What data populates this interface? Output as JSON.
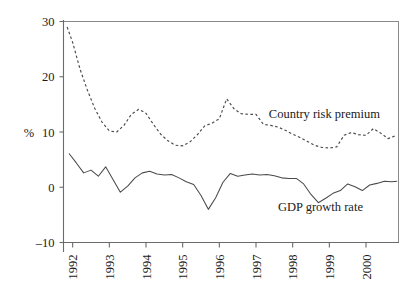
{
  "chart_data": {
    "type": "line",
    "title": "",
    "xlabel": "",
    "ylabel": "%",
    "ylim": [
      -10,
      30
    ],
    "xlim": [
      1991.75,
      2000.9
    ],
    "yticks": [
      30,
      20,
      10,
      0,
      -10
    ],
    "ytick_labels": [
      "30",
      "20",
      "10",
      "0",
      "–10"
    ],
    "xticks": [
      1992,
      1993,
      1994,
      1995,
      1996,
      1997,
      1998,
      1999,
      2000
    ],
    "xtick_labels": [
      "1992",
      "1993",
      "1994",
      "1995",
      "1996",
      "1997",
      "1998",
      "1999",
      "2000"
    ],
    "grid": false,
    "legend_position": "inline-annotation",
    "series": [
      {
        "name": "Country risk premium",
        "style": "dashed",
        "color": "#4a4a4a",
        "label_x": 1997.35,
        "label_y": 12.6,
        "x": [
          1991.85,
          1992.0,
          1992.2,
          1992.4,
          1992.6,
          1992.8,
          1993.0,
          1993.2,
          1993.4,
          1993.6,
          1993.8,
          1994.0,
          1994.2,
          1994.4,
          1994.6,
          1994.8,
          1995.0,
          1995.2,
          1995.4,
          1995.6,
          1995.8,
          1996.0,
          1996.2,
          1996.4,
          1996.6,
          1996.8,
          1997.0,
          1997.2,
          1997.4,
          1997.6,
          1997.8,
          1998.0,
          1998.2,
          1998.4,
          1998.6,
          1998.8,
          1999.0,
          1999.2,
          1999.4,
          1999.6,
          1999.8,
          2000.0,
          2000.2,
          2000.4,
          2000.6,
          2000.8
        ],
        "y": [
          29.0,
          26.2,
          21.4,
          17.6,
          14.3,
          11.8,
          10.2,
          10.0,
          11.2,
          13.2,
          14.1,
          13.4,
          11.4,
          9.6,
          8.4,
          7.6,
          7.5,
          8.2,
          9.5,
          11.1,
          11.6,
          12.4,
          16.0,
          14.2,
          13.3,
          13.2,
          13.2,
          11.4,
          11.2,
          10.9,
          10.3,
          9.6,
          9.0,
          8.3,
          7.6,
          7.2,
          7.1,
          7.3,
          9.4,
          9.9,
          9.5,
          9.4,
          10.6,
          9.8,
          8.8,
          9.3
        ]
      },
      {
        "name": "GDP growth rate",
        "style": "solid",
        "color": "#4a4a4a",
        "label_x": 1997.6,
        "label_y": -4.3,
        "x": [
          1991.9,
          1992.1,
          1992.3,
          1992.5,
          1992.7,
          1992.9,
          1993.1,
          1993.3,
          1993.5,
          1993.7,
          1993.9,
          1994.1,
          1994.3,
          1994.5,
          1994.7,
          1994.9,
          1995.1,
          1995.3,
          1995.5,
          1995.7,
          1995.9,
          1996.1,
          1996.3,
          1996.5,
          1996.7,
          1996.9,
          1997.1,
          1997.3,
          1997.5,
          1997.7,
          1997.9,
          1998.1,
          1998.3,
          1998.5,
          1998.7,
          1998.9,
          1999.1,
          1999.3,
          1999.5,
          1999.7,
          1999.9,
          2000.1,
          2000.3,
          2000.5,
          2000.7,
          2000.85
        ],
        "y": [
          6.1,
          4.4,
          2.6,
          3.1,
          2.0,
          3.7,
          1.4,
          -0.9,
          0.2,
          1.7,
          2.6,
          2.9,
          2.4,
          2.2,
          2.3,
          1.7,
          1.0,
          0.5,
          -1.5,
          -4.0,
          -1.9,
          0.9,
          2.5,
          2.0,
          2.2,
          2.4,
          2.2,
          2.3,
          2.1,
          1.7,
          1.6,
          1.6,
          0.6,
          -1.3,
          -2.8,
          -2.0,
          -1.1,
          -0.6,
          0.6,
          0.1,
          -0.6,
          0.4,
          0.7,
          1.1,
          1.0,
          1.1
        ]
      }
    ]
  }
}
